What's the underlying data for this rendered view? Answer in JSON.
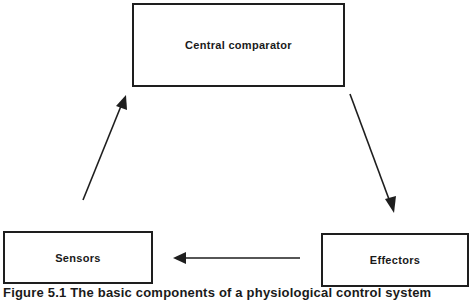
{
  "diagram": {
    "type": "feedback-loop",
    "nodes": [
      {
        "id": "central",
        "label": "Central comparator"
      },
      {
        "id": "effectors",
        "label": "Effectors"
      },
      {
        "id": "sensors",
        "label": "Sensors"
      }
    ],
    "edges": [
      {
        "from": "central",
        "to": "effectors"
      },
      {
        "from": "effectors",
        "to": "sensors"
      },
      {
        "from": "sensors",
        "to": "central"
      }
    ],
    "caption": "Figure 5.1 The basic components of a physiological control system"
  },
  "colors": {
    "stroke": "#1e1e1e",
    "background": "#ffffff"
  }
}
